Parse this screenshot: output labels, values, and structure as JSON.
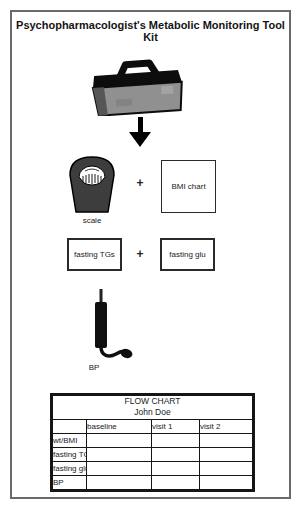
{
  "title": "Psychopharmacologist's Metabolic Monitoring Tool Kit",
  "toolkit": {
    "toolbox_icon": "toolbox",
    "arrow_icon": "down-arrow",
    "scale_label": "scale",
    "plus_1": "+",
    "bmi_chart_label": "BMI chart",
    "fasting_tgs_label": "fasting TGs",
    "plus_2": "+",
    "fasting_glu_label": "fasting glu",
    "bp_label": "BP"
  },
  "flow_chart": {
    "title": "FLOW CHART",
    "patient_name": "John Doe",
    "columns": [
      "baseline",
      "visit 1",
      "visit 2"
    ],
    "rows": [
      "wt/BMI",
      "fasting TGs",
      "fasting glu",
      "BP"
    ]
  },
  "colors": {
    "ink": "#151515",
    "page_border": "#6a6a6a",
    "toolbox_gray": "#909090",
    "scale_gray": "#3d3d3d"
  }
}
